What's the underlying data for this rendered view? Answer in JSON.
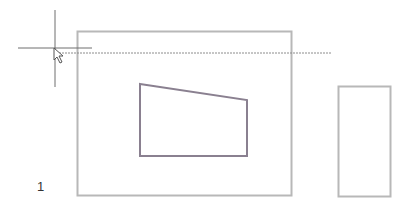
{
  "canvas": {
    "background": "#ffffff",
    "shape_color": "#b8b8b8",
    "inner_shape_color": "#8a8090",
    "crosshair_color": "#6e6e6e",
    "guide_color": "#8c8c8c"
  },
  "shapes": {
    "outer_rectangle": {
      "x": 77,
      "y": 31,
      "width": 214,
      "height": 164
    },
    "inner_quadrilateral": {
      "points": "140,84 247,100 247,156 140,156"
    },
    "side_rectangle": {
      "x": 338,
      "y": 86,
      "width": 52,
      "height": 110
    }
  },
  "guide_line": {
    "x1": 56,
    "y1": 53,
    "x2": 332,
    "y2": 53
  },
  "crosshair": {
    "x": 55,
    "y": 48,
    "v_top": 10,
    "v_bottom": 87,
    "h_left": 18,
    "h_right": 92
  },
  "labels": {
    "viewport_number": "1"
  }
}
